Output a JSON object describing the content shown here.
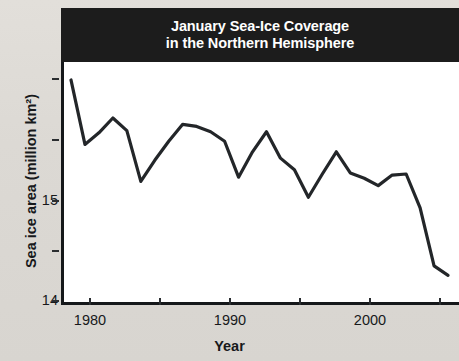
{
  "chart_data": {
    "type": "line",
    "title": "January Sea-Ice Coverage in the Northern Hemisphere",
    "title_line1": "January Sea-Ice Coverage",
    "title_line2": "in the Northern Hemisphere",
    "xlabel": "Year",
    "ylabel": "Sea ice area (million km²)",
    "xlim": [
      1978.5,
      2007.0
    ],
    "ylim": [
      13.45,
      15.75
    ],
    "grid": false,
    "legend": null,
    "x_ticks": [
      1980,
      1990,
      2000
    ],
    "x_tick_labels": [
      "1980",
      "1990",
      "2000"
    ],
    "x_minor_ticks": [
      1985,
      1995,
      2005
    ],
    "y_ticks": [
      14,
      15
    ],
    "y_tick_labels": [
      "14",
      "15"
    ],
    "y_minor_ticks": [
      13.5,
      14.5,
      15.5
    ],
    "line_color": "#232629",
    "line_width": 3.2,
    "x": [
      1979,
      1980,
      1981,
      1982,
      1983,
      1984,
      1985,
      1986,
      1987,
      1988,
      1989,
      1990,
      1991,
      1992,
      1993,
      1994,
      1995,
      1996,
      1997,
      1998,
      1999,
      2000,
      2001,
      2002,
      2003,
      2004,
      2005,
      2006
    ],
    "values": [
      15.58,
      14.97,
      15.08,
      15.22,
      15.1,
      14.62,
      14.82,
      15.0,
      15.16,
      15.14,
      15.09,
      15.0,
      14.66,
      14.9,
      15.09,
      14.84,
      14.73,
      14.47,
      14.69,
      14.9,
      14.7,
      14.65,
      14.58,
      14.68,
      14.69,
      14.37,
      13.82,
      13.73
    ]
  },
  "axes": {
    "y_tick_15": "15",
    "y_tick_14": "14",
    "x_tick_1980": "1980",
    "x_tick_1990": "1990",
    "x_tick_2000": "2000"
  }
}
